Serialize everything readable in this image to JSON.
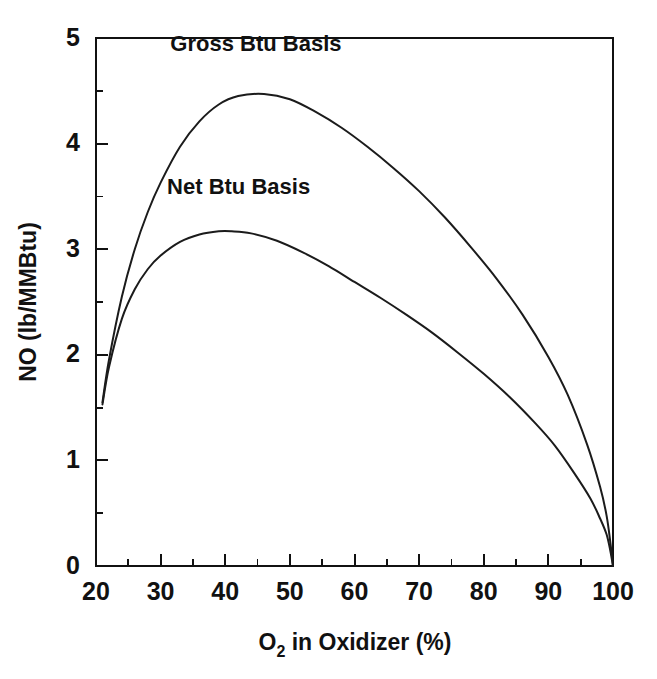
{
  "figure": {
    "background_color": "#ffffff",
    "line_color": "#1b1b1b",
    "axis_color": "#111111",
    "width": 657,
    "height": 679
  },
  "chart_data": {
    "type": "line",
    "title": "",
    "xlabel": "O2 in Oxidizer (%)",
    "xlabel_base": "O",
    "xlabel_sub": "2",
    "xlabel_rest": " in Oxidizer (%)",
    "ylabel": "NO (lb/MMBtu)",
    "xlim": [
      20,
      100
    ],
    "ylim": [
      0,
      5
    ],
    "grid": false,
    "legend_position": "inline-annotation",
    "x_ticks_major": [
      20,
      30,
      40,
      50,
      60,
      70,
      80,
      90,
      100
    ],
    "x_tick_labels": [
      "20",
      "30",
      "40",
      "50",
      "60",
      "70",
      "80",
      "90",
      "100"
    ],
    "x_ticks_minor": [
      25,
      35,
      45,
      55,
      65,
      75,
      85,
      95
    ],
    "y_ticks_major": [
      0,
      1,
      2,
      3,
      4,
      5
    ],
    "y_tick_labels": [
      "0",
      "1",
      "2",
      "3",
      "4",
      "5"
    ],
    "y_ticks_minor": [
      0.5,
      1.5,
      2.5,
      3.5,
      4.5
    ],
    "series": [
      {
        "name": "Gross Btu Basis",
        "label_x": 31.5,
        "label_y": 4.88,
        "x": [
          21,
          22,
          24,
          26,
          28,
          30,
          33,
          36,
          39,
          42,
          46,
          50,
          54,
          58,
          62,
          66,
          70,
          74,
          78,
          82,
          86,
          90,
          93,
          96,
          98,
          99,
          99.6,
          100
        ],
        "y": [
          1.55,
          1.95,
          2.55,
          3.0,
          3.35,
          3.63,
          3.97,
          4.21,
          4.37,
          4.45,
          4.47,
          4.42,
          4.3,
          4.15,
          3.97,
          3.77,
          3.55,
          3.3,
          3.02,
          2.72,
          2.38,
          1.98,
          1.62,
          1.15,
          0.75,
          0.48,
          0.22,
          0.0
        ]
      },
      {
        "name": "Net Btu Basis",
        "label_x": 31.0,
        "label_y": 3.52,
        "x": [
          21,
          22,
          24,
          26,
          28,
          30,
          33,
          36,
          39,
          41,
          44,
          48,
          52,
          56,
          60,
          64,
          68,
          72,
          76,
          80,
          84,
          88,
          91,
          94,
          96.5,
          98,
          99,
          99.6,
          100
        ],
        "y": [
          1.53,
          1.88,
          2.34,
          2.62,
          2.81,
          2.94,
          3.07,
          3.14,
          3.17,
          3.17,
          3.15,
          3.08,
          2.97,
          2.84,
          2.69,
          2.54,
          2.38,
          2.21,
          2.02,
          1.82,
          1.6,
          1.35,
          1.14,
          0.88,
          0.64,
          0.45,
          0.3,
          0.14,
          0.0
        ]
      }
    ]
  }
}
